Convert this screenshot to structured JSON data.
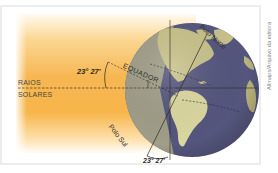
{
  "diagram": {
    "title": "",
    "labels": {
      "rays_line1": "RAIOS",
      "rays_line2": "SOLARES",
      "angle_top": "23° 27'",
      "angle_bottom": "23° 27'",
      "equator": "EQUADOR",
      "north_pole": "Polo Norte",
      "south_pole": "Polo Sul"
    },
    "credit": "Allmaps/Arquivo da editora",
    "colors": {
      "sunlight_orange": "#f6b44a",
      "sunlight_light": "#fde8b8",
      "globe_ocean": "#4e4f7a",
      "globe_land": "#c9c48a",
      "globe_shadow": "#8c8a6e",
      "frame": "#cfcfcf",
      "line": "#3a3524"
    }
  }
}
